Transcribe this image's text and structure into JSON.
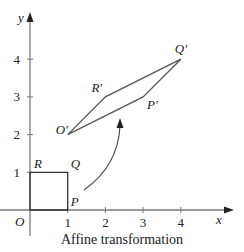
{
  "caption": "Affine transformation",
  "axes": {
    "x_label": "x",
    "y_label": "y",
    "origin_label": "O",
    "x_ticks": [
      1,
      2,
      3,
      4
    ],
    "y_ticks": [
      1,
      2,
      3,
      4
    ],
    "x_range": [
      0,
      5
    ],
    "y_range": [
      0,
      5
    ]
  },
  "original_square": {
    "vertices": [
      {
        "name": "O",
        "x": 0,
        "y": 0
      },
      {
        "name": "P",
        "x": 1,
        "y": 0
      },
      {
        "name": "Q",
        "x": 1,
        "y": 1
      },
      {
        "name": "R",
        "x": 0,
        "y": 1
      }
    ],
    "labels": {
      "P": "P",
      "Q": "Q",
      "R": "R"
    }
  },
  "transformed_parallelogram": {
    "vertices": [
      {
        "name": "O'",
        "x": 1,
        "y": 2
      },
      {
        "name": "P'",
        "x": 3,
        "y": 3
      },
      {
        "name": "Q'",
        "x": 4,
        "y": 4
      },
      {
        "name": "R'",
        "x": 2,
        "y": 3
      }
    ]
  },
  "colors": {
    "axis": "#7a7a7a",
    "shape": "#555555",
    "text": "#222222"
  }
}
